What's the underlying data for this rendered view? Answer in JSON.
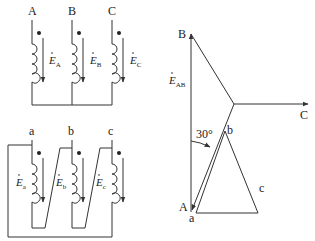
{
  "primary": {
    "terminals": [
      "A",
      "B",
      "C"
    ],
    "emf_labels": [
      {
        "base": "E",
        "sub": "A"
      },
      {
        "base": "E",
        "sub": "B"
      },
      {
        "base": "E",
        "sub": "C"
      }
    ],
    "connection": "star"
  },
  "secondary": {
    "terminals": [
      "a",
      "b",
      "c"
    ],
    "emf_labels": [
      {
        "base": "E",
        "sub": "a"
      },
      {
        "base": "E",
        "sub": "b"
      },
      {
        "base": "E",
        "sub": "c"
      }
    ],
    "connection": "delta"
  },
  "phasor": {
    "primary_vertices": [
      "A",
      "B",
      "C"
    ],
    "secondary_vertices": [
      "a",
      "b",
      "c"
    ],
    "emf_label": {
      "base": "E",
      "sub": "AB"
    },
    "angle_label": "30°"
  },
  "colors": {
    "line": "#333333",
    "text": "#222222",
    "background": "#ffffff"
  }
}
